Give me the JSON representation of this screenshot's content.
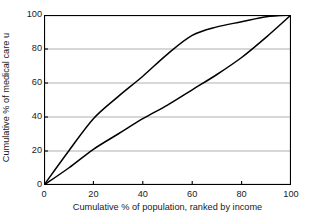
{
  "chart_data": {
    "type": "line",
    "title": "",
    "xlabel": "Cumulative % of population, ranked by income",
    "ylabel": "Cumulative % of medical care u",
    "xlim": [
      0,
      100
    ],
    "ylim": [
      0,
      100
    ],
    "xticks": [
      0,
      20,
      40,
      60,
      80,
      100
    ],
    "yticks": [
      0,
      20,
      40,
      60,
      80,
      100
    ],
    "xtick_labels": [
      "0",
      "20",
      "40",
      "60",
      "80",
      "100"
    ],
    "ytick_labels": [
      "0",
      "20",
      "40",
      "60",
      "80",
      "100"
    ],
    "grid": "horizontal",
    "grid_color": "#b0b0b0",
    "axis_color": "#000000",
    "line_color": "#000000",
    "legend": "none",
    "x": [
      0,
      10,
      20,
      30,
      40,
      50,
      60,
      70,
      80,
      90,
      100
    ],
    "series": [
      {
        "name": "concentration curve (medical care)",
        "values": [
          0,
          20,
          39,
          52,
          64,
          77,
          88,
          93,
          96,
          99,
          100
        ]
      },
      {
        "name": "line of equality / income curve",
        "values": [
          0,
          10,
          21,
          30,
          39,
          47,
          56,
          65,
          75,
          87,
          100
        ]
      }
    ]
  },
  "axes": {
    "ylabel_text": "Cumulative % of medical care u",
    "xlabel_text": "Cumulative % of population, ranked by income"
  }
}
